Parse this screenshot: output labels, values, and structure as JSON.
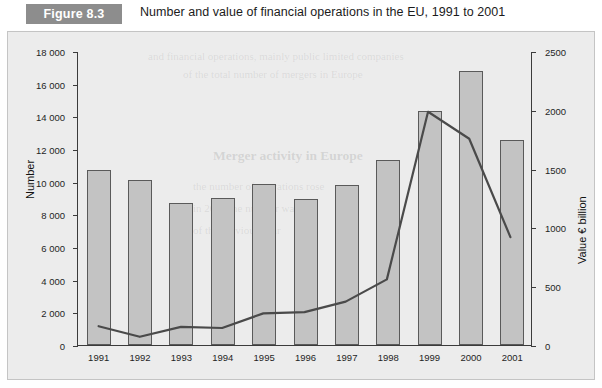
{
  "header": {
    "badge": "Figure 8.3",
    "title": "Number and value of financial operations in the EU, 1991 to 2001"
  },
  "axis": {
    "left_title": "Number",
    "right_title": "Value € billion",
    "left_ticks": [
      "18 000",
      "16 000",
      "14 000",
      "12 000",
      "10 000",
      "8 000",
      "6 000",
      "4 000",
      "2 000",
      "0"
    ],
    "right_ticks": [
      "2500",
      "2000",
      "1500",
      "1000",
      "500",
      "0"
    ]
  },
  "ghost": {
    "heading": "Merger activity in Europe",
    "line1": "and financial operations, mainly public limited companies",
    "line2": "of the total number of mergers in Europe",
    "line3": "the number of operations rose",
    "line4": "in 2001 the number was",
    "line5": "of the previous year"
  },
  "chart_data": {
    "type": "bar",
    "title": "Number and value of financial operations in the EU, 1991 to 2001",
    "xlabel": "",
    "ylabel": "Number",
    "y2label": "Value € billion",
    "categories": [
      "1991",
      "1992",
      "1993",
      "1994",
      "1995",
      "1996",
      "1997",
      "1998",
      "1999",
      "2000",
      "2001"
    ],
    "ylim": [
      0,
      18000
    ],
    "y2lim": [
      0,
      2500
    ],
    "grid": false,
    "legend": "none",
    "series": [
      {
        "name": "Number",
        "type": "bar",
        "axis": "left",
        "color": "#c3c3c3",
        "values": [
          10700,
          10100,
          8700,
          9000,
          9850,
          8950,
          9800,
          11300,
          14350,
          16750,
          12550
        ]
      },
      {
        "name": "Value € billion",
        "type": "line",
        "axis": "right",
        "color": "#4a4a4a",
        "values": [
          160,
          70,
          155,
          145,
          270,
          280,
          370,
          560,
          1990,
          1760,
          920
        ]
      }
    ]
  }
}
